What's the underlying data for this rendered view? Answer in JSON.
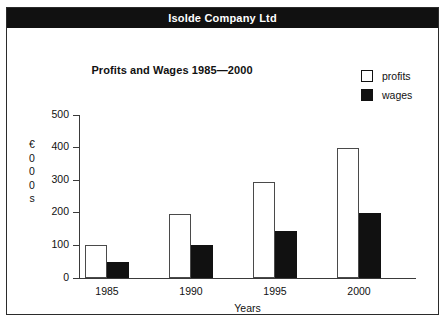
{
  "banner": {
    "title": "Isolde Company Ltd"
  },
  "legend": {
    "items": [
      {
        "label": "profits",
        "swatch": "white-square",
        "color": "#ffffff"
      },
      {
        "label": "wages",
        "swatch": "black-square",
        "color": "#111111"
      }
    ]
  },
  "axis": {
    "y_title_chars": [
      "€",
      "0",
      "0",
      "0",
      "s"
    ],
    "y_title": "€000s",
    "x_title": "Years",
    "yticks": [
      0,
      100,
      200,
      300,
      400,
      500
    ]
  },
  "chart_data": {
    "type": "bar",
    "title": "Profits and Wages 1985—2000",
    "xlabel": "Years",
    "ylabel": "€000s",
    "categories": [
      "1985",
      "1990",
      "1995",
      "2000"
    ],
    "series": [
      {
        "name": "profits",
        "color": "#ffffff",
        "values": [
          100,
          195,
          295,
          398
        ]
      },
      {
        "name": "wages",
        "color": "#111111",
        "values": [
          48,
          100,
          145,
          200
        ]
      }
    ],
    "ylim": [
      0,
      500
    ],
    "yticks": [
      0,
      100,
      200,
      300,
      400,
      500
    ],
    "grid": false,
    "legend_position": "top-right"
  }
}
